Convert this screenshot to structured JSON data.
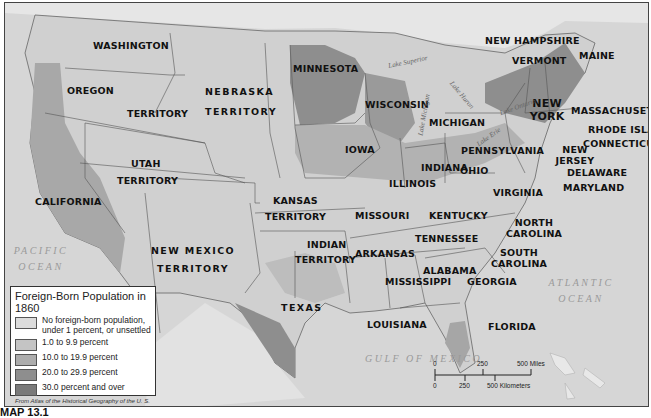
{
  "map": {
    "legend": {
      "title": "Foreign-Born Population in 1860",
      "items": [
        {
          "label": "No foreign-born population, under 1 percent, or unsettled",
          "color": "#dcdcdc"
        },
        {
          "label": "1.0 to 9.9 percent",
          "color": "#c4c4c4"
        },
        {
          "label": "10.0 to 19.9 percent",
          "color": "#adadad"
        },
        {
          "label": "20.0 to 29.9 percent",
          "color": "#8e8e8e"
        },
        {
          "label": "30.0 percent and over",
          "color": "#7a7a7a"
        }
      ],
      "source": "From Atlas of the Historical Geography of the U. S."
    },
    "regions": {
      "washington": "WASHINGTON",
      "oregon": "OREGON",
      "territory_wa": "TERRITORY",
      "nebraska": "NEBRASKA",
      "nebraska_t": "TERRITORY",
      "utah": "UTAH",
      "utah_t": "TERRITORY",
      "california": "CALIFORNIA",
      "new_mexico": "NEW MEXICO",
      "new_mexico_t": "TERRITORY",
      "kansas": "KANSAS",
      "kansas_t": "TERRITORY",
      "indian": "INDIAN",
      "indian_t": "TERRITORY",
      "texas": "TEXAS",
      "minnesota": "MINNESOTA",
      "wisconsin": "WISCONSIN",
      "iowa": "IOWA",
      "illinois": "ILLINOIS",
      "michigan": "MICHIGAN",
      "indiana": "INDIANA",
      "ohio": "OHIO",
      "missouri": "MISSOURI",
      "arkansas": "ARKANSAS",
      "louisiana": "LOUISIANA",
      "mississippi": "MISSISSIPPI",
      "alabama": "ALABAMA",
      "georgia": "GEORGIA",
      "florida": "FLORIDA",
      "tennessee": "TENNESSEE",
      "kentucky": "KENTUCKY",
      "virginia": "VIRGINIA",
      "north_carolina": "NORTH CAROLINA",
      "south_carolina": "SOUTH CAROLINA",
      "pennsylvania": "PENNSYLVANIA",
      "new_york": "NEW YORK",
      "new_jersey": "NEW JERSEY",
      "delaware": "DELAWARE",
      "maryland": "MARYLAND",
      "new_hampshire": "NEW HAMPSHIRE",
      "vermont": "VERMONT",
      "maine": "MAINE",
      "massachusetts": "MASSACHUSETTS",
      "rhode_island": "RHODE ISLAND",
      "connecticut": "CONNECTICUT"
    },
    "water": {
      "pacific": "PACIFIC OCEAN",
      "atlantic": "ATLANTIC OCEAN",
      "gulf": "GULF OF MEXICO",
      "lake_superior": "Lake Superior",
      "lake_michigan": "Lake Michigan",
      "lake_huron": "Lake Huron",
      "lake_erie": "Lake Erie",
      "lake_ontario": "Lake Ontario"
    },
    "scale": {
      "miles_0": "0",
      "miles_250": "250",
      "miles_500": "500 Miles",
      "km_0": "0",
      "km_250": "250",
      "km_500": "500 Kilometers"
    },
    "caption": "MAP 13.1"
  }
}
